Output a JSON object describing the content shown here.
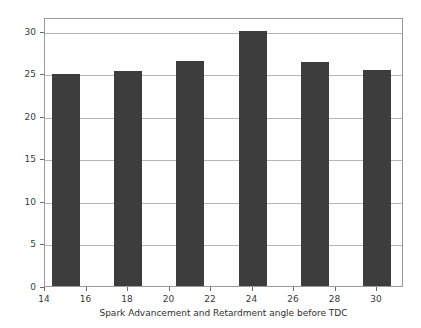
{
  "chart_data": {
    "type": "bar",
    "title": "",
    "xlabel": "Spark Advancement and Retardment angle before TDC",
    "ylabel": "Brake Thermal Efficiency",
    "x": [
      15,
      18,
      21,
      24,
      27,
      30
    ],
    "categories": [
      "15",
      "18",
      "21",
      "24",
      "27",
      "30"
    ],
    "values": [
      24.9,
      25.3,
      26.4,
      29.9,
      26.3,
      25.4
    ],
    "series": [
      {
        "name": "Brake Thermal Efficiency",
        "values": [
          24.9,
          25.3,
          26.4,
          29.9,
          26.3,
          25.4
        ]
      }
    ],
    "xlim": [
      14,
      31.3
    ],
    "ylim": [
      0,
      31.6
    ],
    "xticks": [
      14,
      16,
      18,
      20,
      22,
      24,
      26,
      28,
      30
    ],
    "xtick_labels": [
      "14",
      "16",
      "18",
      "20",
      "22",
      "24",
      "26",
      "28",
      "30"
    ],
    "yticks": [
      0,
      5,
      10,
      15,
      20,
      25,
      30
    ],
    "ytick_labels": [
      "0",
      "5",
      "10",
      "15",
      "20",
      "25",
      "30"
    ],
    "grid": "horizontal",
    "legend": "none",
    "bar_width": 1.35,
    "colors": {
      "bar": "#3d3d3d",
      "background": "#ffffff",
      "gridline": "#b5b5b5",
      "frame": "#9a9a9a",
      "text": "#3a3a3a"
    }
  }
}
